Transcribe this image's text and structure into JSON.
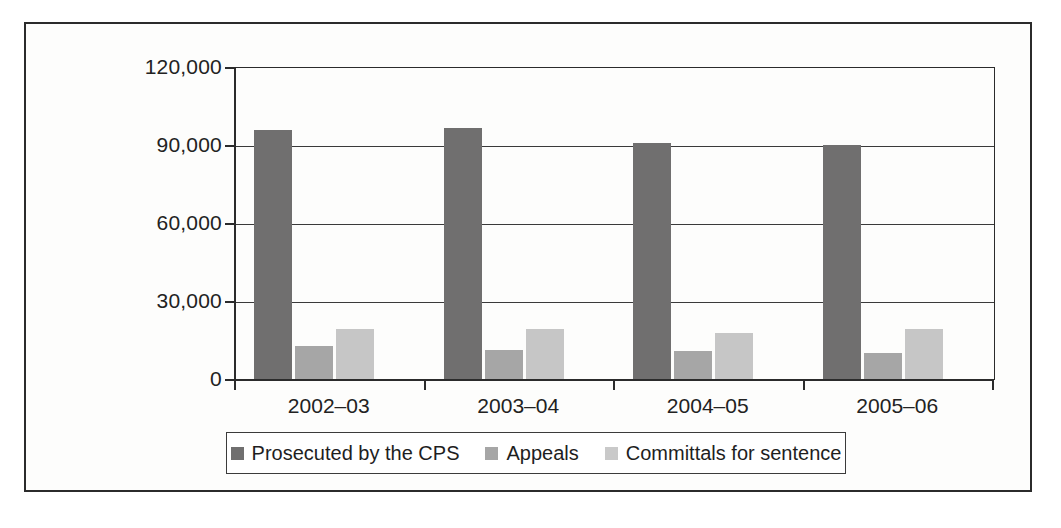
{
  "chart_data": {
    "type": "bar",
    "title": "",
    "subtitle": "",
    "xlabel": "",
    "ylabel": "",
    "categories": [
      "2002–03",
      "2003–04",
      "2004–05",
      "2005–06"
    ],
    "series": [
      {
        "name": "Prosecuted by the CPS",
        "color": "#706f6f",
        "values": [
          96000,
          97000,
          91000,
          90500
        ]
      },
      {
        "name": "Appeals",
        "color": "#a6a6a6",
        "values": [
          13000,
          11500,
          11000,
          10500
        ]
      },
      {
        "name": "Committals for sentence",
        "color": "#c6c6c6",
        "values": [
          19500,
          19500,
          18000,
          19500
        ]
      }
    ],
    "ylim": [
      0,
      120000
    ],
    "yticks": [
      0,
      30000,
      60000,
      90000,
      120000
    ],
    "ytick_labels": [
      "0",
      "30,000",
      "60,000",
      "90,000",
      "120,000"
    ],
    "grid": true,
    "legend_position": "bottom"
  },
  "legend": {
    "items": [
      {
        "label": "Prosecuted by the CPS",
        "swatch": "s0"
      },
      {
        "label": "Appeals",
        "swatch": "s1"
      },
      {
        "label": "Committals for sentence",
        "swatch": "s2"
      }
    ]
  }
}
